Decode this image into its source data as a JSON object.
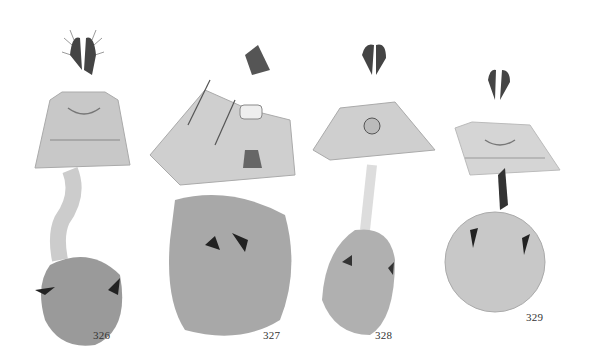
{
  "figure": {
    "background": "#ffffff",
    "panels": [
      {
        "id": "326",
        "label": "326",
        "label_pos": [
          93,
          331
        ],
        "bursa_tone": "#9a9a9a"
      },
      {
        "id": "327",
        "label": "327",
        "label_pos": [
          263,
          331
        ],
        "bursa_tone": "#a8a8a8"
      },
      {
        "id": "328",
        "label": "328",
        "label_pos": [
          375,
          331
        ],
        "bursa_tone": "#b0b0b0"
      },
      {
        "id": "329",
        "label": "329",
        "label_pos": [
          526,
          313
        ],
        "bursa_tone": "#c8c8c8"
      }
    ]
  }
}
